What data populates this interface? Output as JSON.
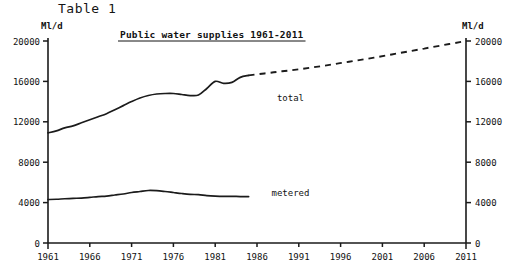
{
  "figure": {
    "table_label": "Table 1",
    "left_unit": "Ml/d",
    "right_unit": "Ml/d"
  },
  "chart_data": {
    "type": "line",
    "title": "Public water supplies 1961-2011",
    "xlabel": "",
    "ylabel": "Ml/d",
    "y2label": "Ml/d",
    "xlim": [
      1961,
      2011
    ],
    "ylim": [
      0,
      20000
    ],
    "grid": false,
    "legend": "inline-labels",
    "xticks": [
      1961,
      1966,
      1971,
      1976,
      1981,
      1986,
      1991,
      1996,
      2001,
      2006,
      2011
    ],
    "xtick_labels": [
      "1961",
      "1966",
      "1971",
      "1976",
      "1981",
      "1986",
      "1991",
      "1996",
      "2001",
      "2006",
      "2011"
    ],
    "yticks": [
      0,
      4000,
      8000,
      12000,
      16000,
      20000
    ],
    "ytick_labels": [
      "0",
      "4000",
      "8000",
      "12000",
      "16000",
      "20000"
    ],
    "y2ticks": [
      0,
      4000,
      8000,
      12000,
      16000,
      20000
    ],
    "y2tick_labels": [
      "0",
      "4000",
      "8000",
      "12000",
      "16000",
      "20000"
    ],
    "series": [
      {
        "name": "total",
        "label": "total",
        "style": "solid",
        "label_x": 1990,
        "label_y": 14100,
        "x": [
          1961,
          1962,
          1963,
          1964,
          1965,
          1966,
          1967,
          1968,
          1969,
          1970,
          1971,
          1972,
          1973,
          1974,
          1975,
          1976,
          1977,
          1978,
          1979,
          1980,
          1981,
          1982,
          1983,
          1984,
          1985
        ],
        "values": [
          10900,
          11100,
          11400,
          11600,
          11900,
          12200,
          12500,
          12800,
          13200,
          13600,
          14000,
          14350,
          14600,
          14750,
          14800,
          14800,
          14700,
          14600,
          14650,
          15300,
          16000,
          15800,
          15900,
          16400,
          16600
        ]
      },
      {
        "name": "total-projection",
        "label": "",
        "style": "dashed",
        "x": [
          1985,
          1988,
          1991,
          1994,
          1997,
          2000,
          2003,
          2006,
          2009,
          2011
        ],
        "values": [
          16600,
          16900,
          17200,
          17550,
          17950,
          18350,
          18800,
          19250,
          19700,
          20000
        ]
      },
      {
        "name": "metered",
        "label": "metered",
        "style": "solid",
        "label_x": 1990,
        "label_y": 4700,
        "x": [
          1961,
          1962,
          1963,
          1964,
          1965,
          1966,
          1967,
          1968,
          1969,
          1970,
          1971,
          1972,
          1973,
          1974,
          1975,
          1976,
          1977,
          1978,
          1979,
          1980,
          1981,
          1982,
          1983,
          1984,
          1985
        ],
        "values": [
          4300,
          4330,
          4380,
          4420,
          4450,
          4520,
          4600,
          4650,
          4750,
          4850,
          5000,
          5100,
          5200,
          5180,
          5100,
          5000,
          4900,
          4820,
          4780,
          4700,
          4650,
          4620,
          4620,
          4600,
          4600
        ]
      }
    ]
  }
}
